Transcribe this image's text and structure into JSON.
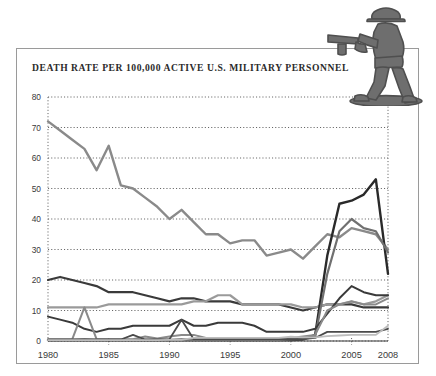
{
  "figure": {
    "title": "DEATH RATE PER 100,000 ACTIVE U.S. MILITARY PERSONNEL",
    "soldier_icon": "toy-soldier-icon",
    "frame_color": "#9a9a9a",
    "background": "#ffffff"
  },
  "chart_data": {
    "type": "line",
    "title": "DEATH RATE PER 100,000 ACTIVE U.S. MILITARY PERSONNEL",
    "xlabel": "",
    "ylabel": "",
    "xlim": [
      1980,
      2008
    ],
    "ylim": [
      0,
      80
    ],
    "yticks": [
      0,
      10,
      20,
      30,
      40,
      50,
      60,
      70,
      80
    ],
    "xticks": [
      1980,
      1985,
      1990,
      1995,
      2000,
      2005,
      2008
    ],
    "grid": true,
    "grid_style": "dotted",
    "legend": "none",
    "x": [
      1980,
      1981,
      1982,
      1983,
      1984,
      1985,
      1986,
      1987,
      1988,
      1989,
      1990,
      1991,
      1992,
      1993,
      1994,
      1995,
      1996,
      1997,
      1998,
      1999,
      2000,
      2001,
      2002,
      2003,
      2004,
      2005,
      2006,
      2007,
      2008
    ],
    "series": [
      {
        "name": "total",
        "color": "#8a8a8a",
        "width": 2.4,
        "values": [
          72,
          69,
          66,
          63,
          56,
          64,
          51,
          50,
          47,
          44,
          40,
          43,
          39,
          35,
          35,
          32,
          33,
          33,
          28,
          29,
          30,
          27,
          31,
          35,
          34,
          37,
          36,
          35,
          30
        ]
      },
      {
        "name": "accident",
        "color": "#3a3a3a",
        "width": 2.2,
        "values": [
          20,
          21,
          20,
          19,
          18,
          16,
          16,
          16,
          15,
          14,
          13,
          14,
          14,
          13,
          13,
          13,
          12,
          12,
          12,
          12,
          11,
          10,
          11,
          12,
          12,
          12,
          11,
          11,
          11
        ]
      },
      {
        "name": "illness",
        "color": "#9a9a9a",
        "width": 2.2,
        "values": [
          11,
          11,
          11,
          11,
          11,
          12,
          12,
          12,
          12,
          12,
          12,
          12,
          13,
          13,
          15,
          15,
          12,
          12,
          12,
          12,
          12,
          11,
          11,
          12,
          12,
          13,
          12,
          13,
          15
        ]
      },
      {
        "name": "hostile-action",
        "color": "#2a2a2a",
        "width": 2.4,
        "values": [
          0.3,
          0.3,
          0.3,
          0.4,
          0.3,
          0.3,
          0.3,
          0.3,
          0.3,
          0.3,
          0.3,
          0.4,
          0.3,
          0.3,
          0.3,
          0.3,
          0.3,
          0.3,
          0.3,
          0.3,
          0.3,
          0.5,
          2,
          28,
          45,
          46,
          48,
          53,
          22
        ]
      },
      {
        "name": "self-inflicted",
        "color": "#707070",
        "width": 2.2,
        "values": [
          0.4,
          0.4,
          0.4,
          0.4,
          0.4,
          0.4,
          0.4,
          0.4,
          0.4,
          0.4,
          0.4,
          0.4,
          0.4,
          0.4,
          0.4,
          0.4,
          0.4,
          0.4,
          0.4,
          0.4,
          0.5,
          0.6,
          1.4,
          22,
          36,
          40,
          37,
          36,
          29
        ]
      },
      {
        "name": "homicide",
        "color": "#3a3a3a",
        "width": 2.0,
        "values": [
          8,
          7,
          6,
          4,
          3,
          4,
          4,
          5,
          5,
          5,
          5,
          7,
          5,
          5,
          6,
          6,
          6,
          5,
          3,
          3,
          3,
          3,
          4,
          9,
          14,
          18,
          16,
          15,
          15
        ]
      },
      {
        "name": "undetermined",
        "color": "#8a8a8a",
        "width": 2.0,
        "values": [
          0.5,
          0.5,
          0.6,
          11,
          0.6,
          0.6,
          0.6,
          0.6,
          1.5,
          0.8,
          1.5,
          2,
          2,
          1,
          1,
          1,
          1,
          1,
          1,
          1,
          1,
          1.5,
          2,
          10,
          12,
          13,
          12,
          12,
          14
        ]
      },
      {
        "name": "other",
        "color": "#4a4a4a",
        "width": 1.8,
        "values": [
          0.5,
          0.5,
          0.5,
          0.5,
          0.5,
          0.5,
          0.5,
          2,
          0.5,
          0.5,
          0.6,
          7,
          0.6,
          0.6,
          0.6,
          0.6,
          0.6,
          0.6,
          0.6,
          0.6,
          0.6,
          0.6,
          1,
          3,
          3,
          3,
          3,
          3,
          4
        ]
      },
      {
        "name": "pending",
        "color": "#bdbdbd",
        "width": 1.8,
        "values": [
          0.3,
          0.3,
          0.3,
          0.3,
          0.3,
          0.3,
          0.3,
          0.3,
          0.3,
          0.3,
          0.4,
          0.4,
          1,
          1,
          1,
          1,
          1,
          1,
          1,
          1,
          1.4,
          1.2,
          1.2,
          1.6,
          1.8,
          2,
          2,
          2,
          5
        ]
      }
    ]
  }
}
